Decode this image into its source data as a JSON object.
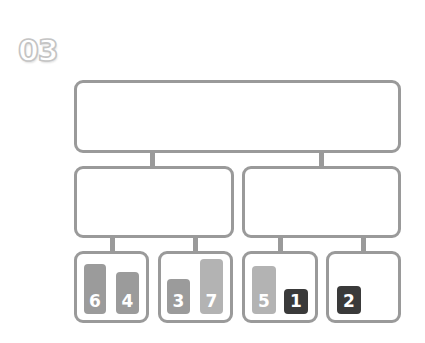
{
  "step": {
    "label": "03"
  },
  "colors": {
    "border": "#9a9a9a",
    "bar_mid": "#9b9b9b",
    "bar_light": "#b3b3b3",
    "bar_dark": "#3a3a3a"
  },
  "diagram": {
    "root": {
      "label": ""
    },
    "branches": [
      {
        "label": "",
        "leaves": [
          {
            "label": "",
            "bars": [
              {
                "value": "6",
                "shade": "mid"
              },
              {
                "value": "4",
                "shade": "mid"
              }
            ]
          },
          {
            "label": "",
            "bars": [
              {
                "value": "3",
                "shade": "mid"
              },
              {
                "value": "7",
                "shade": "light"
              }
            ]
          }
        ]
      },
      {
        "label": "",
        "leaves": [
          {
            "label": "",
            "bars": [
              {
                "value": "5",
                "shade": "light"
              },
              {
                "value": "1",
                "shade": "dark"
              }
            ]
          },
          {
            "label": "",
            "bars": [
              {
                "value": "2",
                "shade": "dark"
              }
            ]
          }
        ]
      }
    ]
  }
}
